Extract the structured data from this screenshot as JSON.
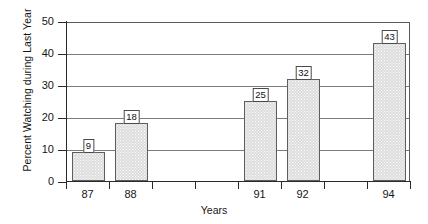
{
  "chart_data": {
    "type": "bar",
    "title": "",
    "xlabel": "Years",
    "ylabel": "Percent Watching during Last Year",
    "categories": [
      "87",
      "88",
      "89",
      "90",
      "91",
      "92",
      "93",
      "94"
    ],
    "tick_labels": [
      "87",
      "88",
      "",
      "",
      "91",
      "92",
      "",
      "94"
    ],
    "values": [
      9,
      18,
      null,
      null,
      25,
      32,
      null,
      43
    ],
    "bars": [
      {
        "category": "87",
        "value": 9,
        "label": "9",
        "slot": 0
      },
      {
        "category": "88",
        "value": 18,
        "label": "18",
        "slot": 1
      },
      {
        "category": "91",
        "value": 25,
        "label": "25",
        "slot": 4
      },
      {
        "category": "92",
        "value": 32,
        "label": "32",
        "slot": 5
      },
      {
        "category": "94",
        "value": 43,
        "label": "43",
        "slot": 7
      }
    ],
    "ylim": [
      0,
      50
    ],
    "yticks": [
      0,
      10,
      20,
      30,
      40,
      50
    ],
    "ytick_labels": [
      "0",
      "10",
      "20",
      "30",
      "40",
      "50"
    ],
    "grid": true,
    "grid_axis": "y",
    "legend": null,
    "bar_fill": "#dcdcdc",
    "bar_edge": "#5e5e5e",
    "axis_color": "#2a2a2a",
    "grid_color": "#7b7b7b",
    "background": "#ffffff",
    "data_labels_boxed": true
  }
}
